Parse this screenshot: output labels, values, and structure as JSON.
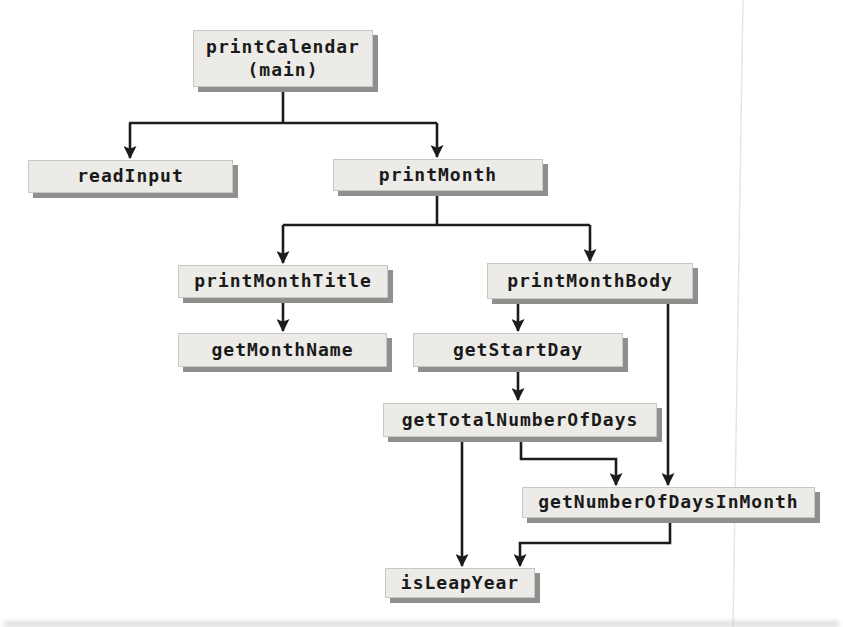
{
  "diagram": {
    "type": "structure-chart",
    "nodes": [
      {
        "id": "printCalendar",
        "label": "printCalendar",
        "sublabel": "(main)"
      },
      {
        "id": "readInput",
        "label": "readInput"
      },
      {
        "id": "printMonth",
        "label": "printMonth"
      },
      {
        "id": "printMonthTitle",
        "label": "printMonthTitle"
      },
      {
        "id": "printMonthBody",
        "label": "printMonthBody"
      },
      {
        "id": "getMonthName",
        "label": "getMonthName"
      },
      {
        "id": "getStartDay",
        "label": "getStartDay"
      },
      {
        "id": "getTotalNumberOfDays",
        "label": "getTotalNumberOfDays"
      },
      {
        "id": "getNumberOfDaysInMonth",
        "label": "getNumberOfDaysInMonth"
      },
      {
        "id": "isLeapYear",
        "label": "isLeapYear"
      }
    ],
    "edges": [
      {
        "from": "printCalendar",
        "to": "readInput"
      },
      {
        "from": "printCalendar",
        "to": "printMonth"
      },
      {
        "from": "printMonth",
        "to": "printMonthTitle"
      },
      {
        "from": "printMonth",
        "to": "printMonthBody"
      },
      {
        "from": "printMonthTitle",
        "to": "getMonthName"
      },
      {
        "from": "printMonthBody",
        "to": "getStartDay"
      },
      {
        "from": "printMonthBody",
        "to": "getNumberOfDaysInMonth"
      },
      {
        "from": "getStartDay",
        "to": "getTotalNumberOfDays"
      },
      {
        "from": "getTotalNumberOfDays",
        "to": "getNumberOfDaysInMonth"
      },
      {
        "from": "getTotalNumberOfDays",
        "to": "isLeapYear"
      },
      {
        "from": "getNumberOfDaysInMonth",
        "to": "isLeapYear"
      }
    ],
    "colors": {
      "page_bg": "#ffffff",
      "box_fill": "#ecebe7",
      "box_shadow": "#8f8f8d",
      "line": "#1c1c1c",
      "text": "#1a1a1a"
    }
  }
}
